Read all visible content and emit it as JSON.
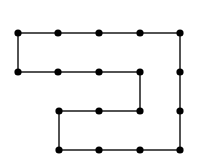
{
  "diagram": {
    "type": "grid-path-graph",
    "background": "#ffffff",
    "line_color": "#1a1a1a",
    "node_color": "#000000",
    "line_width": 1.5,
    "node_radius": 3.6,
    "nodes": [
      {
        "id": "n1",
        "x": 18,
        "y": 33
      },
      {
        "id": "n2",
        "x": 58,
        "y": 33
      },
      {
        "id": "n3",
        "x": 99,
        "y": 33
      },
      {
        "id": "n4",
        "x": 140,
        "y": 33
      },
      {
        "id": "n5",
        "x": 180,
        "y": 33
      },
      {
        "id": "n6",
        "x": 18,
        "y": 72
      },
      {
        "id": "n7",
        "x": 58,
        "y": 72
      },
      {
        "id": "n8",
        "x": 99,
        "y": 72
      },
      {
        "id": "n9",
        "x": 140,
        "y": 72
      },
      {
        "id": "n10",
        "x": 180,
        "y": 72
      },
      {
        "id": "n11",
        "x": 59,
        "y": 111
      },
      {
        "id": "n12",
        "x": 99,
        "y": 111
      },
      {
        "id": "n13",
        "x": 140,
        "y": 111
      },
      {
        "id": "n14",
        "x": 180,
        "y": 111
      },
      {
        "id": "n15",
        "x": 59,
        "y": 150
      },
      {
        "id": "n16",
        "x": 99,
        "y": 150
      },
      {
        "id": "n17",
        "x": 140,
        "y": 150
      },
      {
        "id": "n18",
        "x": 180,
        "y": 150
      }
    ],
    "path_order": [
      "n5",
      "n4",
      "n3",
      "n2",
      "n1",
      "n6",
      "n7",
      "n8",
      "n9",
      "n13",
      "n12",
      "n11",
      "n15",
      "n16",
      "n17",
      "n18",
      "n14",
      "n10",
      "n5"
    ]
  }
}
